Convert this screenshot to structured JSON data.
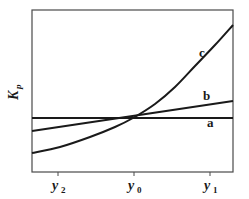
{
  "chart_data": {
    "type": "line",
    "title": "",
    "xlabel": "",
    "ylabel": "K_p",
    "ylabel_main": "K",
    "ylabel_sub": "p",
    "x_ticks": [
      {
        "main": "y",
        "sub": "2",
        "pos": 58
      },
      {
        "main": "y",
        "sub": "0",
        "pos": 134
      },
      {
        "main": "y",
        "sub": "1",
        "pos": 210
      }
    ],
    "grid": false,
    "legend": "inline curve labels",
    "series": [
      {
        "name": "a",
        "label": "a",
        "description": "constant (horizontal line)",
        "points": [
          [
            32,
            118
          ],
          [
            233,
            118
          ]
        ]
      },
      {
        "name": "b",
        "label": "b",
        "description": "linear, gently increasing",
        "points": [
          [
            32,
            131
          ],
          [
            233,
            101
          ]
        ]
      },
      {
        "name": "c",
        "label": "c",
        "description": "exponential increase",
        "points": [
          [
            32,
            153
          ],
          [
            60,
            147
          ],
          [
            90,
            137
          ],
          [
            115,
            127
          ],
          [
            133,
            118
          ],
          [
            155,
            104
          ],
          [
            175,
            87
          ],
          [
            195,
            66
          ],
          [
            215,
            45
          ],
          [
            233,
            25
          ]
        ]
      }
    ],
    "intersection": {
      "x_label": "y0",
      "note": "all curves meet at y0"
    },
    "colors": {
      "line": "#1a1a1a",
      "frame": "#4a4a4a",
      "background": "#ffffff"
    }
  },
  "labels": {
    "a": "a",
    "b": "b",
    "c": "c"
  }
}
